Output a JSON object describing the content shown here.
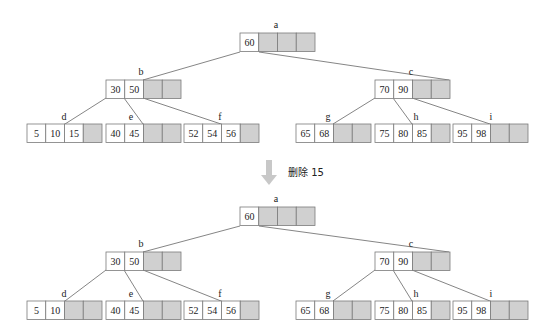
{
  "colors": {
    "cell_border": "#7a7a7a",
    "empty_fill": "#d0d0d0",
    "key_fill": "#ffffff",
    "edge": "#666666",
    "arrow": "#c8c8c8"
  },
  "operation": {
    "label": "删除 15",
    "icon": "down-arrow-icon"
  },
  "trees": [
    {
      "name": "before",
      "nodes": [
        {
          "id": "a",
          "label": "a",
          "keys": [
            "60"
          ],
          "slots": 4,
          "x": 240,
          "y": 33,
          "label_x": 276,
          "label_y": 28
        },
        {
          "id": "b",
          "label": "b",
          "keys": [
            "30",
            "50"
          ],
          "slots": 4,
          "x": 106,
          "y": 80,
          "label_x": 141,
          "label_y": 75
        },
        {
          "id": "c",
          "label": "c",
          "keys": [
            "70",
            "90"
          ],
          "slots": 4,
          "x": 375,
          "y": 80,
          "label_x": 411,
          "label_y": 75
        },
        {
          "id": "d",
          "label": "d",
          "keys": [
            "5",
            "10",
            "15"
          ],
          "slots": 4,
          "x": 27,
          "y": 124,
          "label_x": 64,
          "label_y": 120
        },
        {
          "id": "e",
          "label": "e",
          "keys": [
            "40",
            "45"
          ],
          "slots": 4,
          "x": 106,
          "y": 124,
          "label_x": 131,
          "label_y": 120
        },
        {
          "id": "f",
          "label": "f",
          "keys": [
            "52",
            "54",
            "56"
          ],
          "slots": 4,
          "x": 184,
          "y": 124,
          "label_x": 220,
          "label_y": 120
        },
        {
          "id": "g",
          "label": "g",
          "keys": [
            "65",
            "68"
          ],
          "slots": 4,
          "x": 296,
          "y": 124,
          "label_x": 328,
          "label_y": 120
        },
        {
          "id": "h",
          "label": "h",
          "keys": [
            "75",
            "80",
            "85"
          ],
          "slots": 4,
          "x": 375,
          "y": 124,
          "label_x": 416,
          "label_y": 120
        },
        {
          "id": "i",
          "label": "i",
          "keys": [
            "95",
            "98"
          ],
          "slots": 4,
          "x": 453,
          "y": 124,
          "label_x": 491,
          "label_y": 120
        }
      ],
      "edges": [
        {
          "x1": 240,
          "y1": 52,
          "x2": 143,
          "y2": 80
        },
        {
          "x1": 259,
          "y1": 52,
          "x2": 449,
          "y2": 80
        },
        {
          "x1": 106,
          "y1": 98,
          "x2": 65,
          "y2": 124
        },
        {
          "x1": 124,
          "y1": 98,
          "x2": 143,
          "y2": 124
        },
        {
          "x1": 143,
          "y1": 98,
          "x2": 221,
          "y2": 124
        },
        {
          "x1": 375,
          "y1": 98,
          "x2": 333,
          "y2": 124
        },
        {
          "x1": 393,
          "y1": 98,
          "x2": 412,
          "y2": 124
        },
        {
          "x1": 412,
          "y1": 98,
          "x2": 490,
          "y2": 124
        }
      ]
    },
    {
      "name": "after",
      "nodes": [
        {
          "id": "a",
          "label": "a",
          "keys": [
            "60"
          ],
          "slots": 4,
          "x": 240,
          "y": 207,
          "label_x": 276,
          "label_y": 202
        },
        {
          "id": "b",
          "label": "b",
          "keys": [
            "30",
            "50"
          ],
          "slots": 4,
          "x": 106,
          "y": 252,
          "label_x": 141,
          "label_y": 247
        },
        {
          "id": "c",
          "label": "c",
          "keys": [
            "70",
            "90"
          ],
          "slots": 4,
          "x": 375,
          "y": 252,
          "label_x": 411,
          "label_y": 247
        },
        {
          "id": "d",
          "label": "d",
          "keys": [
            "5",
            "10"
          ],
          "slots": 4,
          "x": 27,
          "y": 301,
          "label_x": 64,
          "label_y": 297
        },
        {
          "id": "e",
          "label": "e",
          "keys": [
            "40",
            "45"
          ],
          "slots": 4,
          "x": 106,
          "y": 301,
          "label_x": 131,
          "label_y": 297
        },
        {
          "id": "f",
          "label": "f",
          "keys": [
            "52",
            "54",
            "56"
          ],
          "slots": 4,
          "x": 184,
          "y": 301,
          "label_x": 220,
          "label_y": 297
        },
        {
          "id": "g",
          "label": "g",
          "keys": [
            "65",
            "68"
          ],
          "slots": 4,
          "x": 296,
          "y": 301,
          "label_x": 328,
          "label_y": 297
        },
        {
          "id": "h",
          "label": "h",
          "keys": [
            "75",
            "80",
            "85"
          ],
          "slots": 4,
          "x": 375,
          "y": 301,
          "label_x": 416,
          "label_y": 297
        },
        {
          "id": "i",
          "label": "i",
          "keys": [
            "95",
            "98"
          ],
          "slots": 4,
          "x": 453,
          "y": 301,
          "label_x": 491,
          "label_y": 297
        }
      ],
      "edges": [
        {
          "x1": 240,
          "y1": 226,
          "x2": 143,
          "y2": 252
        },
        {
          "x1": 259,
          "y1": 226,
          "x2": 449,
          "y2": 252
        },
        {
          "x1": 106,
          "y1": 270,
          "x2": 65,
          "y2": 301
        },
        {
          "x1": 124,
          "y1": 270,
          "x2": 143,
          "y2": 301
        },
        {
          "x1": 143,
          "y1": 270,
          "x2": 221,
          "y2": 301
        },
        {
          "x1": 375,
          "y1": 270,
          "x2": 333,
          "y2": 301
        },
        {
          "x1": 393,
          "y1": 270,
          "x2": 412,
          "y2": 301
        },
        {
          "x1": 412,
          "y1": 270,
          "x2": 490,
          "y2": 301
        }
      ]
    }
  ]
}
